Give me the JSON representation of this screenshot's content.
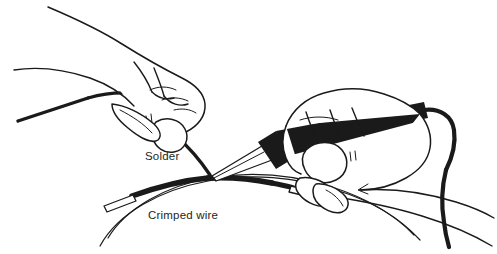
{
  "figure": {
    "type": "line-art-illustration",
    "background_color": "#ffffff",
    "ink_color": "#1a1a1a",
    "text_color": "#231f20",
    "width": 497,
    "height": 254
  },
  "labels": {
    "solder": "Solder",
    "crimped_wire": "Crimped wire"
  },
  "objects": {
    "left_hand_name": "Left hand holding solder",
    "right_hand_name": "Right hand holding soldering iron",
    "solder_wire_name": "Solder wire",
    "iron_name": "Soldering iron",
    "iron_cord_name": "Soldering iron power cord",
    "crimp_sleeve_name": "Crimp sleeve",
    "wire_name": "Wire loop"
  }
}
